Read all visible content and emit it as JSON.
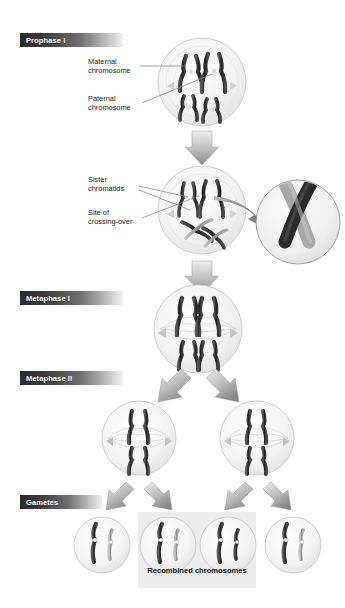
{
  "figure": {
    "background_color": "#ffffff"
  },
  "stages": [
    {
      "id": "prophase-1",
      "label": "Prophase I",
      "x": 20,
      "y": 33,
      "width": 103
    },
    {
      "id": "metaphase-1",
      "label": "Metaphase I",
      "x": 20,
      "y": 291,
      "width": 103
    },
    {
      "id": "metaphase-2",
      "label": "Metaphase II",
      "x": 20,
      "y": 371,
      "width": 103
    },
    {
      "id": "gametes",
      "label": "Gametes",
      "x": 20,
      "y": 495,
      "width": 82
    }
  ],
  "annotations": [
    {
      "id": "maternal",
      "line1": "Maternal",
      "line2": "chromosome",
      "x": 88,
      "y": 57
    },
    {
      "id": "paternal",
      "line1": "Paternal",
      "line2": "chromosome",
      "x": 88,
      "y": 94
    },
    {
      "id": "sister",
      "line1": "Sister",
      "line2": "chromatids",
      "x": 88,
      "y": 175
    },
    {
      "id": "crossover",
      "line1": "Site of",
      "line2": "crossing-over",
      "x": 88,
      "y": 208
    }
  ],
  "recombined": {
    "caption": "Recombined chromosomes",
    "box": {
      "x": 138,
      "y": 512,
      "width": 118,
      "height": 76
    },
    "caption_x": 138,
    "caption_y": 566,
    "caption_width": 118,
    "highlight_color": "#ececec"
  },
  "colors": {
    "label_bar_dark": "#2b2b2b",
    "label_bar_light": "#f2f2f2",
    "label_text": "#ffffff",
    "chromosome_dark": "#2f2f2f",
    "chromosome_light": "#9a9a9a",
    "cell_fill": "#f4f4f4",
    "cell_stroke": "#c9c9c9",
    "arrow_light": "#e2e2e2",
    "arrow_dark": "#8d8d8d",
    "leader_line": "#8a8a8a",
    "annotation_text": "#1a1a1a"
  },
  "cells": [
    {
      "id": "cell-prophase-1",
      "cx": 202,
      "cy": 82,
      "r": 44,
      "stage": "Prophase I"
    },
    {
      "id": "cell-crossing-over",
      "cx": 202,
      "cy": 210,
      "r": 44,
      "stage": "Prophase I crossing over"
    },
    {
      "id": "cell-metaphase-1",
      "cx": 198,
      "cy": 329,
      "r": 44,
      "stage": "Metaphase I"
    },
    {
      "id": "cell-metaphase-2-left",
      "cx": 139,
      "cy": 438,
      "r": 37,
      "stage": "Metaphase II"
    },
    {
      "id": "cell-metaphase-2-right",
      "cx": 257,
      "cy": 438,
      "r": 37,
      "stage": "Metaphase II"
    },
    {
      "id": "gamete-1",
      "cx": 102,
      "cy": 545,
      "r": 28,
      "stage": "Gamete"
    },
    {
      "id": "gamete-2",
      "cx": 168,
      "cy": 545,
      "r": 28,
      "stage": "Gamete"
    },
    {
      "id": "gamete-3",
      "cx": 228,
      "cy": 545,
      "r": 28,
      "stage": "Gamete"
    },
    {
      "id": "gamete-4",
      "cx": 293,
      "cy": 545,
      "r": 28,
      "stage": "Gamete"
    }
  ],
  "inset": {
    "id": "crossing-over-magnifier",
    "cx": 298,
    "cy": 222,
    "r": 42,
    "description": "Magnified view of chiasma where two chromatids cross"
  },
  "arrows": [
    {
      "id": "arrow-prophase-to-crossover",
      "type": "down",
      "x": 202,
      "y": 132
    },
    {
      "id": "arrow-crossover-to-metaphase1",
      "type": "down",
      "x": 202,
      "y": 262
    },
    {
      "id": "arrow-metaphase1-to-left",
      "type": "down-left",
      "x": 168,
      "y": 372
    },
    {
      "id": "arrow-metaphase1-to-right",
      "type": "down-right",
      "x": 232,
      "y": 372
    },
    {
      "id": "arrow-gamete-1",
      "type": "down-left",
      "x": 118,
      "y": 484
    },
    {
      "id": "arrow-gamete-2",
      "type": "down-right",
      "x": 160,
      "y": 484
    },
    {
      "id": "arrow-gamete-3",
      "type": "down-left",
      "x": 240,
      "y": 484
    },
    {
      "id": "arrow-gamete-4",
      "type": "down-right",
      "x": 282,
      "y": 484
    }
  ]
}
